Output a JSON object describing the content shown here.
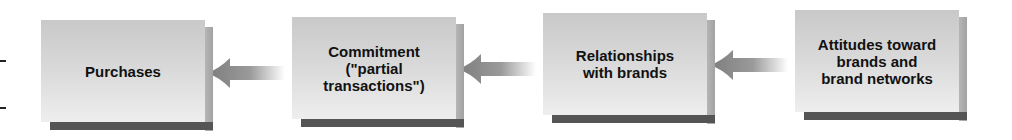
{
  "diagram": {
    "boxes": [
      {
        "label": "Purchases"
      },
      {
        "label": "Commitment\n(\"partial\ntransactions\")"
      },
      {
        "label": "Relationships\nwith brands"
      },
      {
        "label": "Attitudes toward\nbrands and\nbrand networks"
      }
    ],
    "arrows": [
      {
        "from": "Commitment (\"partial transactions\")",
        "to": "Purchases",
        "direction": "left"
      },
      {
        "from": "Relationships with brands",
        "to": "Commitment (\"partial transactions\")",
        "direction": "left"
      },
      {
        "from": "Attitudes toward brands and brand networks",
        "to": "Relationships with brands",
        "direction": "left"
      }
    ],
    "colors": {
      "box_face": "#d8d8d8",
      "box_shadow": "#555555",
      "arrow": "#8a8a8a",
      "text": "#111111"
    }
  }
}
